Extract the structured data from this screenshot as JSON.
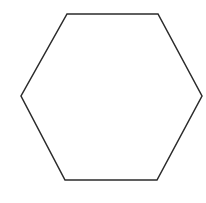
{
  "diagram": {
    "shape": "hexagon",
    "orientation": "flat-top",
    "stroke_color": "#2b2b2b",
    "fill_color": "#ffffff",
    "background_color": "#ffffff",
    "stroke_width": 1.5,
    "vertices": [
      [
        67,
        14
      ],
      [
        158,
        14
      ],
      [
        202,
        96
      ],
      [
        157,
        180
      ],
      [
        65,
        180
      ],
      [
        21,
        96
      ]
    ]
  }
}
